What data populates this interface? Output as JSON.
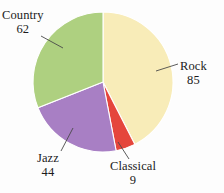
{
  "chart_data": {
    "type": "pie",
    "title": "",
    "categories": [
      "Rock",
      "Classical",
      "Jazz",
      "Country"
    ],
    "values": [
      85,
      9,
      44,
      62
    ],
    "total": 200,
    "legend": "none",
    "labels_position": "outside-with-leader-lines",
    "slices": [
      {
        "name": "Rock",
        "value": 85,
        "color": "#f8ecb8",
        "start_angle_deg": 0,
        "end_angle_deg": 153,
        "label_text": "Rock",
        "value_text": "85"
      },
      {
        "name": "Classical",
        "value": 9,
        "color": "#e5463c",
        "start_angle_deg": 153,
        "end_angle_deg": 169.2,
        "label_text": "Classical",
        "value_text": "9"
      },
      {
        "name": "Jazz",
        "value": 44,
        "color": "#a87fc4",
        "start_angle_deg": 169.2,
        "end_angle_deg": 248.4,
        "label_text": "Jazz",
        "value_text": "44"
      },
      {
        "name": "Country",
        "value": 62,
        "color": "#aed080",
        "start_angle_deg": 248.4,
        "end_angle_deg": 360,
        "label_text": "Country",
        "value_text": "62"
      }
    ],
    "colors": {
      "rock": "#f8ecb8",
      "classical": "#e5463c",
      "jazz": "#a87fc4",
      "country": "#aed080",
      "background": "#fdfdfd",
      "text": "#1b1b1b",
      "leader_line": "#4a4a4a"
    },
    "geometry": {
      "center_x": 103,
      "center_y": 82,
      "radius": 70
    }
  }
}
